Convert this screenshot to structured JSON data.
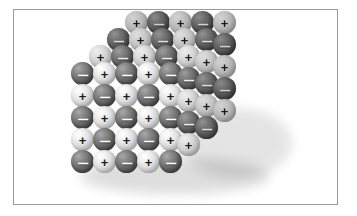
{
  "figure": {
    "background_color": "#ffffff",
    "border_color": "#9a9a9a"
  },
  "legend": {
    "anion_symbol": "–",
    "cation_symbol": "+",
    "anion_label": "negative-ion",
    "cation_label": "positive-ion",
    "anion_color": "#6f6f6f",
    "cation_color": "#dedede"
  },
  "lattice": {
    "type": "rock-salt-cubic",
    "front_face_rows": 5,
    "front_face_cols": 5,
    "depth_layers": 4,
    "sphere_diameter_px": 23,
    "col_spacing_px": 22,
    "row_spacing_px": 22,
    "depth_offset_x_px": 18,
    "depth_offset_y_px": -17,
    "front_origin_x_px": 57,
    "front_origin_y_px": 52
  },
  "chart_data": {
    "type": "scatter",
    "xlabel": "",
    "ylabel": "",
    "series": [
      {
        "name": "negative ions",
        "symbol": "–",
        "color": "#6f6f6f",
        "count": 44
      },
      {
        "name": "positive ions",
        "symbol": "+",
        "color": "#dedede",
        "count": 44
      }
    ],
    "front_face_pattern": [
      [
        "–",
        "+",
        "–",
        "+",
        "–"
      ],
      [
        "+",
        "–",
        "+",
        "–",
        "+"
      ],
      [
        "–",
        "+",
        "–",
        "+",
        "–"
      ],
      [
        "+",
        "–",
        "+",
        "–",
        "+"
      ],
      [
        "–",
        "+",
        "–",
        "+",
        "–"
      ]
    ]
  }
}
